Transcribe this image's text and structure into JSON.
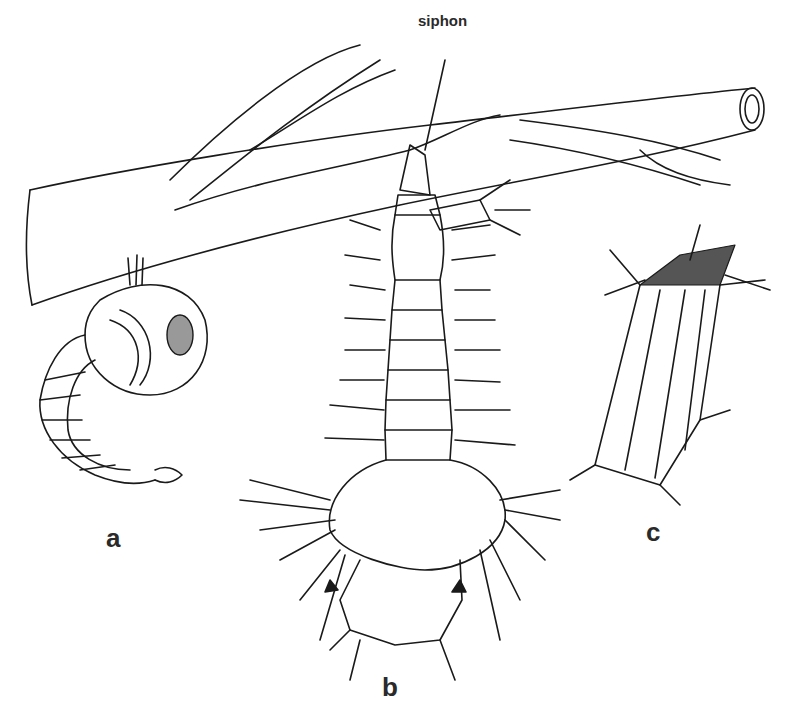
{
  "figure": {
    "callout_label": "siphon",
    "panels": [
      {
        "id": "a",
        "label": "a",
        "subject": "pupa hanging beneath a floating stem"
      },
      {
        "id": "b",
        "label": "b",
        "subject": "larva with siphon attached to plant stem"
      },
      {
        "id": "c",
        "label": "c",
        "subject": "siphon tip detail"
      }
    ]
  },
  "colors": {
    "ink": "#1a1a1a",
    "background": "#ffffff"
  }
}
